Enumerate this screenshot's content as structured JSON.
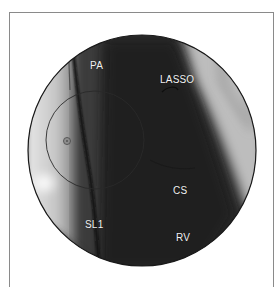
{
  "figure": {
    "type": "fluoroscopy-image",
    "shape": "circular field of view inside open-bottom frame",
    "labels": [
      {
        "id": "pa",
        "text": "PA",
        "x": 90,
        "y": 61
      },
      {
        "id": "lasso",
        "text": "LASSO",
        "x": 160,
        "y": 75
      },
      {
        "id": "cs",
        "text": "CS",
        "x": 173,
        "y": 186
      },
      {
        "id": "sl1",
        "text": "SL1",
        "x": 85,
        "y": 220
      },
      {
        "id": "rv",
        "text": "RV",
        "x": 176,
        "y": 233
      }
    ],
    "colors": {
      "frame": "#8a8a8a",
      "label_text": "#f2f2f2",
      "fov_outline": "#1a1a1a",
      "background": "#ffffff"
    }
  }
}
